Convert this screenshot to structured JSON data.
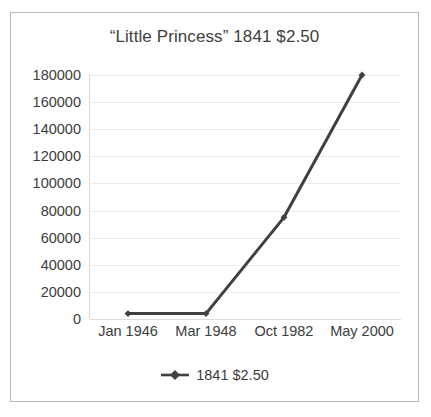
{
  "chart_data": {
    "type": "line",
    "title": "“Little Princess” 1841 $2.50",
    "xlabel": "",
    "ylabel": "",
    "categories": [
      "Jan 1946",
      "Mar 1948",
      "Oct 1982",
      "May 2000"
    ],
    "series": [
      {
        "name": "1841 $2.50",
        "values": [
          4000,
          4000,
          75000,
          180000
        ],
        "color": "#404040",
        "marker": "diamond"
      }
    ],
    "ylim": [
      0,
      180000
    ],
    "yticks": [
      0,
      20000,
      40000,
      60000,
      80000,
      100000,
      120000,
      140000,
      160000,
      180000
    ],
    "ytick_labels": [
      "0",
      "20000",
      "40000",
      "60000",
      "80000",
      "100000",
      "120000",
      "140000",
      "160000",
      "180000"
    ],
    "grid": "horizontal",
    "legend_position": "bottom",
    "legend_entries": [
      "1841 $2.50"
    ],
    "frame_border_color": "#b9b9b9",
    "gridline_color": "#ebebeb",
    "background_color": "#ffffff",
    "text_color": "#3c3c3c"
  }
}
